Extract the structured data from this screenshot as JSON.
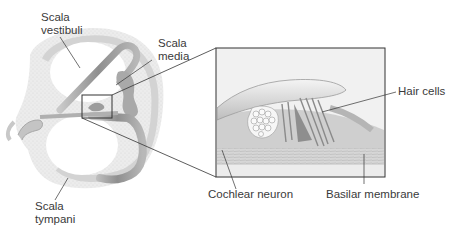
{
  "figure": {
    "labels": {
      "scala_vestibuli": [
        "Scala",
        "vestibuli"
      ],
      "scala_media": [
        "Scala",
        "media"
      ],
      "scala_tympani": [
        "Scala",
        "tympani"
      ],
      "hair_cells": "Hair cells",
      "cochlear_neuron": "Cochlear neuron",
      "basilar_membrane": "Basilar membrane"
    },
    "colors": {
      "bone": "#e6e6e6",
      "duct": "#9a9a9a",
      "duct_light": "#c8c8c8",
      "line": "#333333",
      "text": "#3a3a3a",
      "inset_bg": "#f2f2f2"
    }
  }
}
